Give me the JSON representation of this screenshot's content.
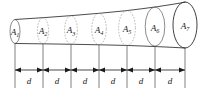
{
  "figure": {
    "type": "technical-diagram",
    "colors": {
      "background": "#ffffff",
      "outline": "#2b2b2b",
      "section": "#5a5a5a",
      "dimension": "#1a1a1a"
    },
    "areas": [
      {
        "id": "a1",
        "symbol": "A",
        "subscript": "1",
        "cx": 15,
        "cy": 31.5,
        "rx": 5.0,
        "ry": 12.0,
        "style": "solid"
      },
      {
        "id": "a2",
        "symbol": "A",
        "subscript": "2",
        "cx": 43,
        "cy": 30.8,
        "rx": 5.6,
        "ry": 13.0,
        "style": "dashed"
      },
      {
        "id": "a3",
        "symbol": "A",
        "subscript": "3",
        "cx": 71,
        "cy": 30.0,
        "rx": 6.4,
        "ry": 14.2,
        "style": "dashed"
      },
      {
        "id": "a4",
        "symbol": "A",
        "subscript": "4",
        "cx": 99,
        "cy": 29.0,
        "rx": 7.3,
        "ry": 15.6,
        "style": "dashed"
      },
      {
        "id": "a5",
        "symbol": "A",
        "subscript": "5",
        "cx": 127,
        "cy": 28.0,
        "rx": 8.4,
        "ry": 17.4,
        "style": "dashed"
      },
      {
        "id": "a6",
        "symbol": "A",
        "subscript": "6",
        "cx": 155,
        "cy": 26.6,
        "rx": 9.8,
        "ry": 19.6,
        "style": "solid"
      },
      {
        "id": "a7",
        "symbol": "A",
        "subscript": "7",
        "cx": 185,
        "cy": 25.0,
        "rx": 12.0,
        "ry": 23.0,
        "style": "mouth"
      }
    ],
    "dimensions": {
      "label": "d",
      "count": 6,
      "ticks": [
        15,
        43,
        71,
        99,
        127,
        155,
        185
      ],
      "labels": [
        "d",
        "d",
        "d",
        "d",
        "d",
        "d"
      ],
      "baseline_y": 70,
      "tick_top_y": 44,
      "tick_bottom_y": 88
    }
  }
}
